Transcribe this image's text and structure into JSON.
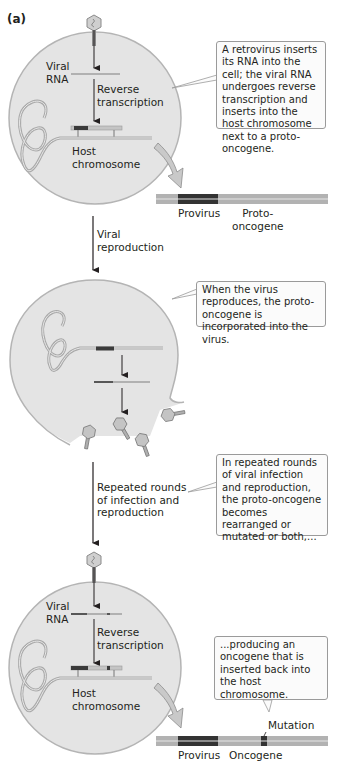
{
  "figure": {
    "panel_label": "(a)",
    "colors": {
      "cell_fill": "#e4e4e4",
      "cell_border": "#b4b4b4",
      "strand_light": "#b8b8b8",
      "provirus_dark": "#3a3a3a",
      "arrow_fill": "#c9c9c9",
      "callout_border": "#9a9a9a"
    },
    "stage1": {
      "viral_rna_label": [
        "Viral",
        "RNA"
      ],
      "reverse_transcription_label": [
        "Reverse",
        "transcription"
      ],
      "host_chromosome_label": [
        "Host",
        "chromosome"
      ],
      "callout": "A retrovirus inserts its RNA into the cell; the viral RNA undergoes reverse transcription and inserts into the host chromosome next to a proto-oncogene.",
      "gene_bar_labels": {
        "provirus": "Provirus",
        "proto_oncogene": [
          "Proto-",
          "oncogene"
        ]
      }
    },
    "step_viral_reproduction": [
      "Viral",
      "reproduction"
    ],
    "stage2": {
      "callout": "When the virus reproduces, the proto-oncogene is incorporated into the virus."
    },
    "step_repeated_rounds": [
      "Repeated rounds",
      "of infection and",
      "reproduction"
    ],
    "stage3_callout": "In repeated rounds of viral infection and reproduction, the proto-oncogene becomes rearranged or mutated or both,...",
    "stage4": {
      "viral_rna_label": [
        "Viral",
        "RNA"
      ],
      "reverse_transcription_label": [
        "Reverse",
        "transcription"
      ],
      "host_chromosome_label": [
        "Host",
        "chromosome"
      ],
      "callout": "...producing an oncogene that is inserted back into the host chromosome.",
      "mutation_label": "Mutation",
      "gene_bar_labels": {
        "provirus": "Provirus",
        "oncogene": "Oncogene"
      }
    }
  }
}
